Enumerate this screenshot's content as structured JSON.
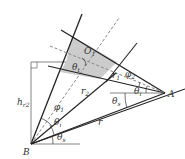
{
  "diagram": {
    "points": {
      "A": {
        "label": "A",
        "x": 165,
        "y": 93
      },
      "B": {
        "label": "B",
        "x": 31,
        "y": 144
      },
      "O": {
        "label": "O",
        "x": 88,
        "y": 55
      }
    },
    "labels": {
      "A": "A",
      "B": "B",
      "O": "O",
      "O_sub": "1",
      "h": "h",
      "h_sub": "r2",
      "r": "r",
      "r1": "r",
      "r1_sub": "1",
      "r2": "r",
      "r2_sub": "2",
      "phi1": "φ",
      "phi1_sub": "1",
      "phi2": "φ",
      "phi2_sub": "2",
      "theta_top": "θ",
      "theta_top_sub": "t",
      "theta_i_A": "θ",
      "theta_i_A_sub": "i",
      "theta_s_A": "θ",
      "theta_s_A_sub": "s",
      "theta_i_B": "θ",
      "theta_i_B_sub": "i",
      "theta_s_B": "θ",
      "theta_s_B_sub": "s"
    },
    "colors": {
      "line": "#222222",
      "dashed": "#888888",
      "shade": "#cccccc",
      "thin": "#666666"
    }
  }
}
